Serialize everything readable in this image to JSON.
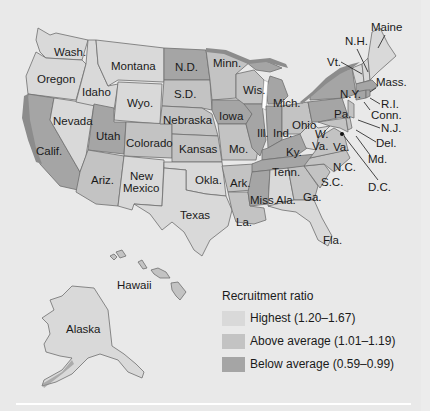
{
  "map": {
    "subject": "United States recruitment ratio by state",
    "states": [
      {
        "name": "Maine",
        "category": "highest"
      },
      {
        "name": "N.H.",
        "category": "highest"
      },
      {
        "name": "Vt.",
        "category": "highest"
      },
      {
        "name": "Mass.",
        "category": "below_average"
      },
      {
        "name": "R.I.",
        "category": "below_average"
      },
      {
        "name": "Conn.",
        "category": "below_average"
      },
      {
        "name": "N.Y.",
        "category": "below_average"
      },
      {
        "name": "N.J.",
        "category": "above_average"
      },
      {
        "name": "Pa.",
        "category": "below_average"
      },
      {
        "name": "Del.",
        "category": "above_average"
      },
      {
        "name": "Md.",
        "category": "above_average"
      },
      {
        "name": "D.C.",
        "category": "below_average"
      },
      {
        "name": "W. Va.",
        "category": "highest"
      },
      {
        "name": "Va.",
        "category": "above_average"
      },
      {
        "name": "N.C.",
        "category": "above_average"
      },
      {
        "name": "S.C.",
        "category": "above_average"
      },
      {
        "name": "Ga.",
        "category": "above_average"
      },
      {
        "name": "Fla.",
        "category": "highest"
      },
      {
        "name": "Ala.",
        "category": "highest"
      },
      {
        "name": "Miss.",
        "category": "below_average"
      },
      {
        "name": "Tenn.",
        "category": "below_average"
      },
      {
        "name": "Ky.",
        "category": "below_average"
      },
      {
        "name": "Ohio",
        "category": "above_average"
      },
      {
        "name": "Ind.",
        "category": "below_average"
      },
      {
        "name": "Mich.",
        "category": "below_average"
      },
      {
        "name": "Ill.",
        "category": "below_average"
      },
      {
        "name": "Wis.",
        "category": "above_average"
      },
      {
        "name": "Minn.",
        "category": "above_average"
      },
      {
        "name": "Iowa",
        "category": "below_average"
      },
      {
        "name": "Mo.",
        "category": "above_average"
      },
      {
        "name": "Ark.",
        "category": "above_average"
      },
      {
        "name": "La.",
        "category": "above_average"
      },
      {
        "name": "Texas",
        "category": "highest"
      },
      {
        "name": "Okla.",
        "category": "highest"
      },
      {
        "name": "Kansas",
        "category": "above_average"
      },
      {
        "name": "Nebraska",
        "category": "above_average"
      },
      {
        "name": "S.D.",
        "category": "above_average"
      },
      {
        "name": "N.D.",
        "category": "below_average"
      },
      {
        "name": "Montana",
        "category": "highest"
      },
      {
        "name": "Wyo.",
        "category": "highest"
      },
      {
        "name": "Colorado",
        "category": "above_average"
      },
      {
        "name": "New Mexico",
        "category": "highest"
      },
      {
        "name": "Ariz.",
        "category": "above_average"
      },
      {
        "name": "Utah",
        "category": "below_average"
      },
      {
        "name": "Nevada",
        "category": "highest"
      },
      {
        "name": "Idaho",
        "category": "highest"
      },
      {
        "name": "Oregon",
        "category": "highest"
      },
      {
        "name": "Wash.",
        "category": "highest"
      },
      {
        "name": "Calif.",
        "category": "below_average"
      },
      {
        "name": "Alaska",
        "category": "highest"
      },
      {
        "name": "Hawaii",
        "category": "above_average"
      }
    ],
    "labels": {
      "maine": "Maine",
      "nh": "N.H.",
      "vt": "Vt.",
      "mass": "Mass.",
      "ri": "R.I.",
      "conn": "Conn.",
      "ny": "N.Y.",
      "nj": "N.J.",
      "pa": "Pa.",
      "del": "Del.",
      "md": "Md.",
      "dc": "D.C.",
      "wva_w": "W.",
      "wva_va": "Va.",
      "va": "Va.",
      "nc": "N.C.",
      "sc": "S.C.",
      "ga": "Ga.",
      "fla": "Fla.",
      "ala": "Ala.",
      "miss": "Miss.",
      "tenn": "Tenn.",
      "ky": "Ky.",
      "ohio": "Ohio",
      "ind": "Ind.",
      "mich": "Mich.",
      "ill": "Ill.",
      "wis": "Wis.",
      "minn": "Minn.",
      "iowa": "Iowa",
      "mo": "Mo.",
      "ark": "Ark.",
      "la": "La.",
      "texas": "Texas",
      "okla": "Okla.",
      "kansas": "Kansas",
      "nebraska": "Nebraska",
      "sd": "S.D.",
      "nd": "N.D.",
      "montana": "Montana",
      "wyo": "Wyo.",
      "colorado": "Colorado",
      "nm_1": "New",
      "nm_2": "Mexico",
      "ariz": "Ariz.",
      "utah": "Utah",
      "nevada": "Nevada",
      "idaho": "Idaho",
      "oregon": "Oregon",
      "wash": "Wash.",
      "calif": "Calif.",
      "alaska": "Alaska",
      "hawaii": "Hawaii"
    },
    "colors": {
      "highest": "#d9d9d9",
      "above_average": "#c3c3c3",
      "below_average": "#a5a5a5",
      "background": "#e9e9e9"
    }
  },
  "legend": {
    "title": "Recruitment ratio",
    "items": [
      {
        "label": "Highest (1.20–1.67)",
        "color": "#d9d9d9"
      },
      {
        "label": "Above average (1.01–1.19)",
        "color": "#c3c3c3"
      },
      {
        "label": "Below average (0.59–0.99)",
        "color": "#a5a5a5"
      }
    ]
  }
}
